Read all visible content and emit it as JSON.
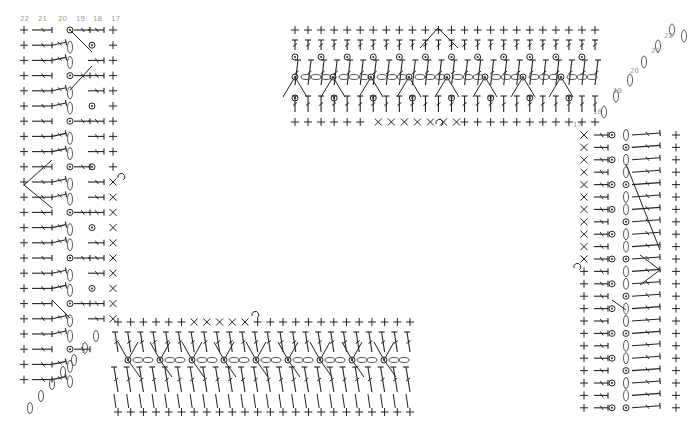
{
  "diagram": {
    "type": "crochet-stitch-chart",
    "colors": {
      "stitch": "#222222",
      "label": "#9a9a9a",
      "background": "#ffffff"
    },
    "left_section": {
      "row_labels": [
        "22",
        "21",
        "20",
        "19",
        "18",
        "17"
      ],
      "row_label_x": [
        24,
        42,
        62,
        80,
        97,
        115
      ],
      "row_label_y": 21,
      "vertical_strip": {
        "x0": 20,
        "rows": 24,
        "top": 30,
        "row_gap": 15.2
      },
      "horizontal_strip": {
        "x0": 108,
        "x1": 400,
        "y_top": 322,
        "y_bottom": 412,
        "cols": 24
      }
    },
    "right_section": {
      "row_labels": [
        {
          "text": "22",
          "x": 664,
          "y": 38
        },
        {
          "text": "21",
          "x": 651,
          "y": 53
        },
        {
          "text": "20",
          "x": 630,
          "y": 73
        },
        {
          "text": "19",
          "x": 613,
          "y": 93
        },
        {
          "text": "18",
          "x": 593,
          "y": 114
        },
        {
          "text": "17",
          "x": 573,
          "y": 127
        }
      ],
      "horizontal_strip": {
        "x0": 295,
        "x1": 595,
        "y_top": 30,
        "y_bottom": 122,
        "cols": 24
      },
      "vertical_strip": {
        "x0": 580,
        "x1": 680,
        "top": 135,
        "rows": 24,
        "row_gap": 12.4
      }
    },
    "legend_symbols": [
      "single-crochet (+)",
      "half-double-crochet (T)",
      "double-crochet (T with slash)",
      "chain (oval)",
      "slip-stitch (dot)",
      "picot loop (hook)",
      "crossed stitch (x)"
    ]
  }
}
